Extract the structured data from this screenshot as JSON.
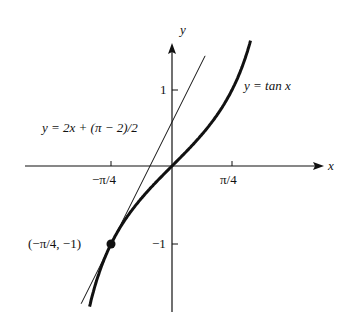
{
  "chart_data": {
    "type": "line",
    "title": "",
    "xlabel": "x",
    "ylabel": "y",
    "x_ticks": [
      "−π/4",
      "π/4"
    ],
    "y_ticks": [
      "1",
      "−1"
    ],
    "series": [
      {
        "name": "y = tan x",
        "function": "tan(x)",
        "style": "thick"
      },
      {
        "name": "y = 2x + (π − 2)/2",
        "function": "2x + (pi-2)/2",
        "style": "thin"
      }
    ],
    "annotations": [
      {
        "label": "(−π/4, −1)",
        "x": -0.7854,
        "y": -1
      }
    ],
    "grid": false
  },
  "labels": {
    "x_axis": "x",
    "y_axis": "y",
    "tick_neg": "−π/4",
    "tick_pos": "π/4",
    "tick_one": "1",
    "tick_neg_one": "−1",
    "curve": "y = tan x",
    "tangent": "y = 2x + (π − 2)/2",
    "point": "(−π/4, −1)"
  }
}
